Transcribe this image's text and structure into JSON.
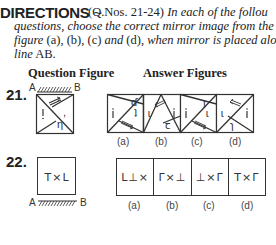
{
  "directions": {
    "heading": "DIRECTIONS",
    "separator": "~",
    "qnos": "(Q.Nos. 21-24)",
    "line1_italic": "In each of the follou",
    "line2_italic_a": "questions, choose the correct mirror image from the ans",
    "line3_italic_a": "figure",
    "line3_options": "(a), (b), (c)",
    "line3_and": "and",
    "line3_d": "(d),",
    "line3_italic_b": "when mirror is placed along",
    "line4_italic": "line",
    "line4_ab": "AB."
  },
  "headers": {
    "question_figure": "Question Figure",
    "answer_figures": "Answer Figures"
  },
  "questions": [
    {
      "number": "21.",
      "mirror_left": "A",
      "mirror_right": "B",
      "mirror_position": "top",
      "question_figure": "square-with-diagonal-triangles-arrow-symbols",
      "options": [
        {
          "label": "(a)"
        },
        {
          "label": "(b)"
        },
        {
          "label": "(c)"
        },
        {
          "label": "(d)"
        }
      ]
    },
    {
      "number": "22.",
      "mirror_left": "A",
      "mirror_right": "B",
      "mirror_position": "bottom",
      "question_figure_text": "T×L",
      "options": [
        {
          "label": "(a)",
          "text": "L⊥×"
        },
        {
          "label": "(b)",
          "text": "Γ×⊥"
        },
        {
          "label": "(c)",
          "text": "⊥×Γ"
        },
        {
          "label": "(d)",
          "text": "T×Γ"
        }
      ]
    }
  ]
}
